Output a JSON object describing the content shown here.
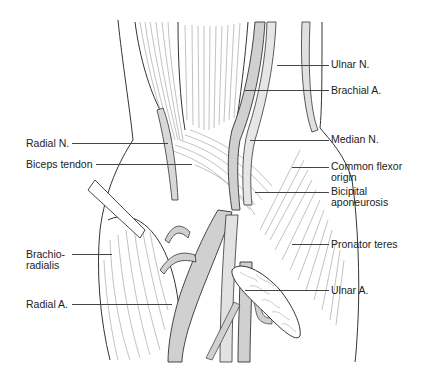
{
  "figure": {
    "colors": {
      "background": "#ffffff",
      "outline": "#333333",
      "fiber": "#888888",
      "vessel_fill": "#d4d4d4",
      "nerve_fill": "#e4e4e4",
      "label_text": "#222222",
      "leader_line": "#444444"
    }
  },
  "labels": {
    "left": [
      {
        "id": "radial_n",
        "text": "Radial N."
      },
      {
        "id": "biceps_tendon",
        "text": "Biceps tendon"
      },
      {
        "id": "brachioradialis_1",
        "text": "Brachio-"
      },
      {
        "id": "brachioradialis_2",
        "text": "radialis"
      },
      {
        "id": "radial_a",
        "text": "Radial A."
      }
    ],
    "right": [
      {
        "id": "ulnar_n",
        "text": "Ulnar N."
      },
      {
        "id": "brachial_a",
        "text": "Brachial A."
      },
      {
        "id": "median_n",
        "text": "Median N."
      },
      {
        "id": "common_flexor_1",
        "text": "Common flexor"
      },
      {
        "id": "common_flexor_2",
        "text": "origin"
      },
      {
        "id": "bicipital_1",
        "text": "Bicipital"
      },
      {
        "id": "bicipital_2",
        "text": "aponeurosis"
      },
      {
        "id": "pronator_teres",
        "text": "Pronator teres"
      },
      {
        "id": "ulnar_a",
        "text": "Ulnar A."
      }
    ]
  }
}
